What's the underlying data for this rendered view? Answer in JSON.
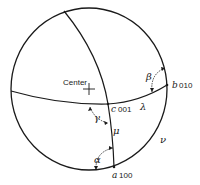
{
  "diagram": {
    "type": "stereographic-projection",
    "center_label": "Center",
    "poles": [
      {
        "axis": "a",
        "index": "100"
      },
      {
        "axis": "b",
        "index": "010"
      },
      {
        "axis": "c",
        "index": "001"
      }
    ],
    "angles": {
      "alpha": "α",
      "beta": "β",
      "gamma": "γ"
    },
    "arcs": {
      "lambda": "λ",
      "mu": "μ",
      "nu": "ν"
    },
    "colors": {
      "ink": "#1a1a1a",
      "background": "#ffffff"
    }
  }
}
